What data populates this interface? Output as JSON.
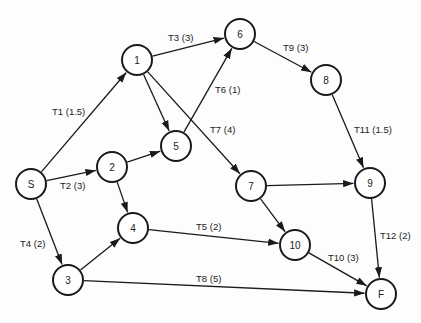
{
  "diagram": {
    "type": "activity-network",
    "nodes": [
      {
        "id": "S",
        "label": "S",
        "x": 31,
        "y": 184
      },
      {
        "id": "1",
        "label": "1",
        "x": 137,
        "y": 60
      },
      {
        "id": "2",
        "label": "2",
        "x": 112,
        "y": 167
      },
      {
        "id": "3",
        "label": "3",
        "x": 68,
        "y": 280
      },
      {
        "id": "4",
        "label": "4",
        "x": 133,
        "y": 228
      },
      {
        "id": "5",
        "label": "5",
        "x": 176,
        "y": 146
      },
      {
        "id": "6",
        "label": "6",
        "x": 240,
        "y": 34
      },
      {
        "id": "7",
        "label": "7",
        "x": 251,
        "y": 186
      },
      {
        "id": "8",
        "label": "8",
        "x": 326,
        "y": 80
      },
      {
        "id": "9",
        "label": "9",
        "x": 370,
        "y": 183
      },
      {
        "id": "10",
        "label": "10",
        "x": 295,
        "y": 245
      },
      {
        "id": "F",
        "label": "F",
        "x": 381,
        "y": 294
      }
    ],
    "edges": [
      {
        "from": "S",
        "to": "1",
        "label": "T1 (1.5)",
        "lx": 52,
        "ly": 115
      },
      {
        "from": "S",
        "to": "2",
        "label": "T2 (3)",
        "lx": 60,
        "ly": 189
      },
      {
        "from": "S",
        "to": "3",
        "label": "T4 (2)",
        "lx": 20,
        "ly": 247
      },
      {
        "from": "1",
        "to": "6",
        "label": "T3 (3)",
        "lx": 168,
        "ly": 41
      },
      {
        "from": "1",
        "to": "5",
        "label": "",
        "lx": 0,
        "ly": 0
      },
      {
        "from": "1",
        "to": "7",
        "label": "T7 (4)",
        "lx": 210,
        "ly": 133
      },
      {
        "from": "2",
        "to": "5",
        "label": "",
        "lx": 0,
        "ly": 0
      },
      {
        "from": "2",
        "to": "4",
        "label": "",
        "lx": 0,
        "ly": 0
      },
      {
        "from": "5",
        "to": "6",
        "label": "T6 (1)",
        "lx": 215,
        "ly": 93
      },
      {
        "from": "3",
        "to": "4",
        "label": "",
        "lx": 0,
        "ly": 0
      },
      {
        "from": "3",
        "to": "F",
        "label": "T8 (5)",
        "lx": 196,
        "ly": 282
      },
      {
        "from": "4",
        "to": "10",
        "label": "T5 (2)",
        "lx": 196,
        "ly": 230
      },
      {
        "from": "6",
        "to": "8",
        "label": "T9 (3)",
        "lx": 283,
        "ly": 51
      },
      {
        "from": "8",
        "to": "9",
        "label": "T11 (1.5)",
        "lx": 354,
        "ly": 133
      },
      {
        "from": "7",
        "to": "9",
        "label": "",
        "lx": 0,
        "ly": 0
      },
      {
        "from": "7",
        "to": "10",
        "label": "",
        "lx": 0,
        "ly": 0
      },
      {
        "from": "9",
        "to": "F",
        "label": "T12 (2)",
        "lx": 380,
        "ly": 239
      },
      {
        "from": "10",
        "to": "F",
        "label": "T10 (3)",
        "lx": 328,
        "ly": 261
      }
    ],
    "node_radius": 15,
    "colors": {
      "stroke": "#1a1a1a",
      "fill": "#ffffff",
      "text": "#222222"
    }
  }
}
